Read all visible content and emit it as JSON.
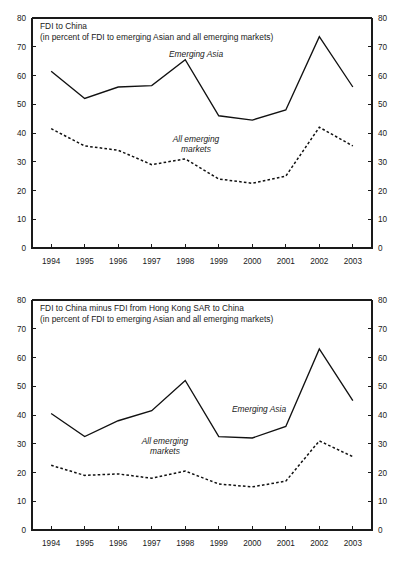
{
  "figure": {
    "background_color": "#ffffff",
    "line_color": "#111111"
  },
  "chart_data": [
    {
      "type": "line",
      "id": "fdi-to-china",
      "title": "FDI to China",
      "subtitle": "(in percent of FDI to emerging Asian and all emerging markets)",
      "xlabel": "",
      "ylabel": "",
      "x": [
        1994,
        1995,
        1996,
        1997,
        1998,
        1999,
        2000,
        2001,
        2002,
        2003
      ],
      "categories": [
        "1994",
        "1995",
        "1996",
        "1997",
        "1998",
        "1999",
        "2000",
        "2001",
        "2002",
        "2003"
      ],
      "ylim": [
        0,
        80
      ],
      "yticks": [
        0,
        10,
        20,
        30,
        40,
        50,
        60,
        70,
        80
      ],
      "ytick_labels": [
        "0",
        "10",
        "20",
        "30",
        "40",
        "50",
        "60",
        "70",
        "80"
      ],
      "dual_axis": true,
      "grid": false,
      "legend_position": "inline-annotation",
      "series": [
        {
          "name": "Emerging Asia",
          "style": "solid",
          "annotation": "Emerging Asia",
          "values": [
            61.5,
            52.0,
            56.0,
            56.5,
            65.5,
            46.0,
            44.5,
            48.0,
            73.5,
            56.0
          ]
        },
        {
          "name": "All emerging markets",
          "style": "dashed",
          "annotation": "All emerging\nmarkets",
          "annotation_line1": "All emerging",
          "annotation_line2": "markets",
          "values": [
            41.5,
            35.5,
            34.0,
            29.0,
            31.0,
            24.0,
            22.5,
            25.0,
            42.0,
            35.5
          ]
        }
      ]
    },
    {
      "type": "line",
      "id": "fdi-to-china-minus-hk",
      "title": "FDI to China minus FDI from Hong Kong SAR to China",
      "subtitle": "(in percent of FDI to emerging Asian and all emerging markets)",
      "xlabel": "",
      "ylabel": "",
      "x": [
        1994,
        1995,
        1996,
        1997,
        1998,
        1999,
        2000,
        2001,
        2002,
        2003
      ],
      "categories": [
        "1994",
        "1995",
        "1996",
        "1997",
        "1998",
        "1999",
        "2000",
        "2001",
        "2002",
        "2003"
      ],
      "ylim": [
        0,
        80
      ],
      "yticks": [
        0,
        10,
        20,
        30,
        40,
        50,
        60,
        70,
        80
      ],
      "ytick_labels": [
        "0",
        "10",
        "20",
        "30",
        "40",
        "50",
        "60",
        "70",
        "80"
      ],
      "dual_axis": true,
      "grid": false,
      "legend_position": "inline-annotation",
      "series": [
        {
          "name": "Emerging Asia",
          "style": "solid",
          "annotation": "Emerging Asia",
          "values": [
            40.5,
            32.5,
            38.0,
            41.5,
            52.0,
            32.5,
            32.0,
            36.0,
            63.0,
            45.0
          ]
        },
        {
          "name": "All emerging markets",
          "style": "dashed",
          "annotation": "All emerging\nmarkets",
          "annotation_line1": "All emerging",
          "annotation_line2": "markets",
          "values": [
            22.5,
            19.0,
            19.5,
            18.0,
            20.5,
            16.0,
            15.0,
            17.0,
            31.0,
            25.5
          ]
        }
      ]
    }
  ],
  "panels": {
    "top": {
      "title": "FDI to China",
      "subtitle": "(in percent of FDI to emerging Asian and all emerging markets)",
      "annotation_asia": "Emerging Asia",
      "annotation_all_l1": "All emerging",
      "annotation_all_l2": "markets"
    },
    "bottom": {
      "title": "FDI to China minus FDI from Hong Kong SAR to China",
      "subtitle": "(in percent of FDI to emerging Asian and all emerging markets)",
      "annotation_asia": "Emerging Asia",
      "annotation_all_l1": "All emerging",
      "annotation_all_l2": "markets"
    }
  }
}
